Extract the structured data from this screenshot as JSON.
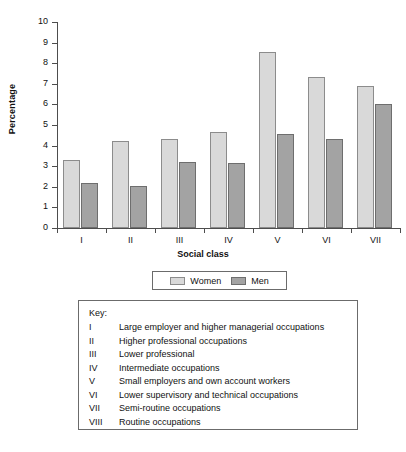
{
  "chart_data": {
    "type": "bar",
    "title": "",
    "subtitle": "",
    "xlabel": "Social class",
    "ylabel": "Percentage",
    "categories": [
      "I",
      "II",
      "III",
      "IV",
      "V",
      "VI",
      "VII"
    ],
    "series": [
      {
        "name": "Women",
        "color": "#d9d9d9",
        "values": [
          3.3,
          4.2,
          4.3,
          4.65,
          8.55,
          7.35,
          6.9
        ]
      },
      {
        "name": "Men",
        "color": "#a3a3a3",
        "values": [
          2.2,
          2.05,
          3.2,
          3.15,
          4.55,
          4.3,
          6.0
        ]
      }
    ],
    "ylim": [
      0,
      10
    ],
    "ytick_labels": [
      "10",
      "9",
      "8",
      "7",
      "6",
      "5",
      "4",
      "3",
      "2",
      "1",
      "0"
    ],
    "ytick_values": [
      10,
      9,
      8,
      7,
      6,
      5,
      4,
      3,
      2,
      1,
      0
    ],
    "grid": false,
    "legend_position": "bottom-center"
  },
  "legend": {
    "items": [
      {
        "label": "Women",
        "swatch": "light-gray-swatch"
      },
      {
        "label": "Men",
        "swatch": "dark-gray-swatch"
      }
    ]
  },
  "key": {
    "title": "Key:",
    "rows": [
      {
        "numeral": "I",
        "description": "Large employer and higher managerial occupations"
      },
      {
        "numeral": "II",
        "description": "Higher professional occupations"
      },
      {
        "numeral": "III",
        "description": "Lower professional"
      },
      {
        "numeral": "IV",
        "description": "Intermediate occupations"
      },
      {
        "numeral": "V",
        "description": "Small employers and own account workers"
      },
      {
        "numeral": "VI",
        "description": "Lower supervisory and technical occupations"
      },
      {
        "numeral": "VII",
        "description": "Semi-routine occupations"
      },
      {
        "numeral": "VIII",
        "description": "Routine occupations"
      }
    ]
  }
}
